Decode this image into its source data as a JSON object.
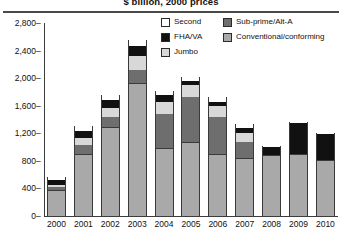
{
  "chart_data": {
    "type": "bar",
    "title": "$ billion, 2000 prices",
    "xlabel": "",
    "ylabel": "",
    "ylim": [
      0,
      2800
    ],
    "yticks": [
      "0",
      "400",
      "800",
      "1,200",
      "1,600",
      "2,000",
      "2,400",
      "2,800"
    ],
    "grid": false,
    "stacked": true,
    "legend_position": "top-right",
    "categories": [
      "2000",
      "2001",
      "2002",
      "2003",
      "2004",
      "2005",
      "2006",
      "2007",
      "2008",
      "2009",
      "2010"
    ],
    "series": [
      {
        "name": "Conventional/conforming",
        "color": "#a9a9a9",
        "values": [
          380,
          900,
          1290,
          1930,
          980,
          1080,
          900,
          840,
          890,
          900,
          810
        ]
      },
      {
        "name": "Sub-prime/Alt-A",
        "color": "#6e6e6e",
        "values": [
          40,
          130,
          150,
          190,
          500,
          640,
          540,
          240,
          0,
          0,
          0
        ]
      },
      {
        "name": "Jumbo",
        "color": "#d8d8d8",
        "values": [
          35,
          100,
          130,
          200,
          170,
          180,
          160,
          130,
          0,
          0,
          0
        ]
      },
      {
        "name": "FHA/VA",
        "color": "#111111",
        "values": [
          70,
          110,
          110,
          150,
          100,
          60,
          60,
          70,
          110,
          450,
          380
        ]
      },
      {
        "name": "Second",
        "color": "#ffffff",
        "values": [
          35,
          70,
          70,
          80,
          60,
          60,
          60,
          50,
          20,
          20,
          20
        ]
      }
    ],
    "totals": [
      560,
      1310,
      1750,
      2550,
      1810,
      2020,
      1720,
      1330,
      1020,
      1370,
      1210
    ]
  },
  "legend": {
    "items": [
      {
        "label": "Second",
        "color": "#ffffff"
      },
      {
        "label": "Sub-prime/Alt-A",
        "color": "#6e6e6e"
      },
      {
        "label": "FHA/VA",
        "color": "#111111"
      },
      {
        "label": "Conventional/conforming",
        "color": "#a9a9a9"
      },
      {
        "label": "Jumbo",
        "color": "#d8d8d8"
      }
    ]
  }
}
